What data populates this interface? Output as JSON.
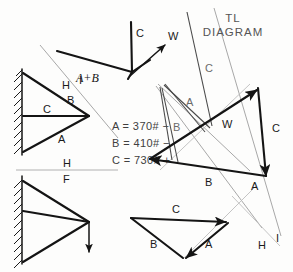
{
  "title": {
    "line1": "TL",
    "line2": "DIAGRAM"
  },
  "force_values": [
    {
      "name": "A",
      "text": "A = 370# −"
    },
    {
      "name": "B",
      "text": "B = 410# −"
    },
    {
      "name": "C",
      "text": "C = 730# +"
    }
  ],
  "space_diagram_upper": {
    "members": [
      {
        "label": "B",
        "name": "member-b"
      },
      {
        "label": "C",
        "name": "member-c"
      },
      {
        "label": "A",
        "name": "member-a"
      }
    ],
    "ray_labels": [
      {
        "label": "H",
        "name": "ray-label-h-upper"
      },
      {
        "label": "I",
        "name": "ray-label-i-upper"
      }
    ]
  },
  "space_diagram_lower": {
    "labels": [
      {
        "label": "H",
        "name": "divider-label-h"
      },
      {
        "label": "F",
        "name": "divider-label-f"
      }
    ]
  },
  "top_vector_group": {
    "resultant_label": "A+B",
    "member_label_c": "C",
    "load_label_w": "W"
  },
  "force_polygon": {
    "label_w": "W",
    "label_c": "C",
    "label_b": "B",
    "label_a": "A",
    "ray_labels": [
      {
        "label": "C",
        "name": "polygon-ray-label-c"
      },
      {
        "label": "A",
        "name": "polygon-ray-label-a"
      },
      {
        "label": "B",
        "name": "polygon-ray-label-b"
      }
    ]
  },
  "bottom_triangle": {
    "label_c": "C",
    "label_b": "B",
    "label_a": "A"
  },
  "ray_labels_lower_right": [
    {
      "label": "H",
      "name": "ray-label-h-lower"
    },
    {
      "label": "I",
      "name": "ray-label-i-lower"
    }
  ],
  "colors": {
    "ink": "#141414",
    "ray_light": "#a8a8a8",
    "ray_dark": "#4a4a4a",
    "paper": "#fdfdfc"
  }
}
